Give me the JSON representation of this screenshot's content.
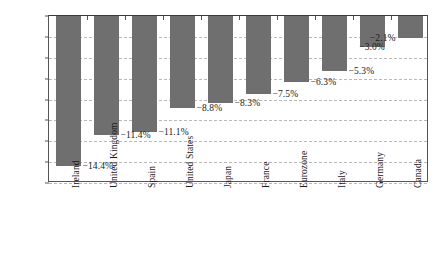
{
  "chart_data": {
    "type": "bar",
    "title": "",
    "subtitle": "",
    "xlabel": "",
    "ylabel": "",
    "ylim": [
      -16,
      0
    ],
    "grid": true,
    "legend": null,
    "orientation": "vertical",
    "bar_color": "#6f6f6f",
    "categories": [
      "Ireland",
      "United Kingdom",
      "Spain",
      "United States",
      "Japan",
      "France",
      "Eurozone",
      "Italy",
      "Germany",
      "Canada"
    ],
    "values": [
      -14.4,
      -11.4,
      -11.1,
      -8.8,
      -8.3,
      -7.5,
      -6.3,
      -5.3,
      -3.0,
      -2.1
    ],
    "data_labels": [
      "−14.4%",
      "−11.4%",
      "−11.1%",
      "−8.8%",
      "−8.3%",
      "−7.5%",
      "−6.3%",
      "−5.3%",
      "−3.0%",
      "−2.1%"
    ],
    "label_placement": [
      "right",
      "right",
      "right",
      "right",
      "right",
      "right",
      "right",
      "right",
      "center",
      "left"
    ],
    "yticks": [
      0,
      -2,
      -4,
      -6,
      -8,
      -10,
      -12,
      -14,
      -16
    ],
    "ytick_labels": [
      "0%",
      "−2%",
      "−4%",
      "−6%",
      "−8%",
      "−10%",
      "−12%",
      "−14%",
      "−16%"
    ]
  },
  "style": {
    "background": "#ffffff",
    "axis_color": "#555555",
    "grid_color": "#b9b9b9",
    "text_color": "#1a1a1a"
  }
}
